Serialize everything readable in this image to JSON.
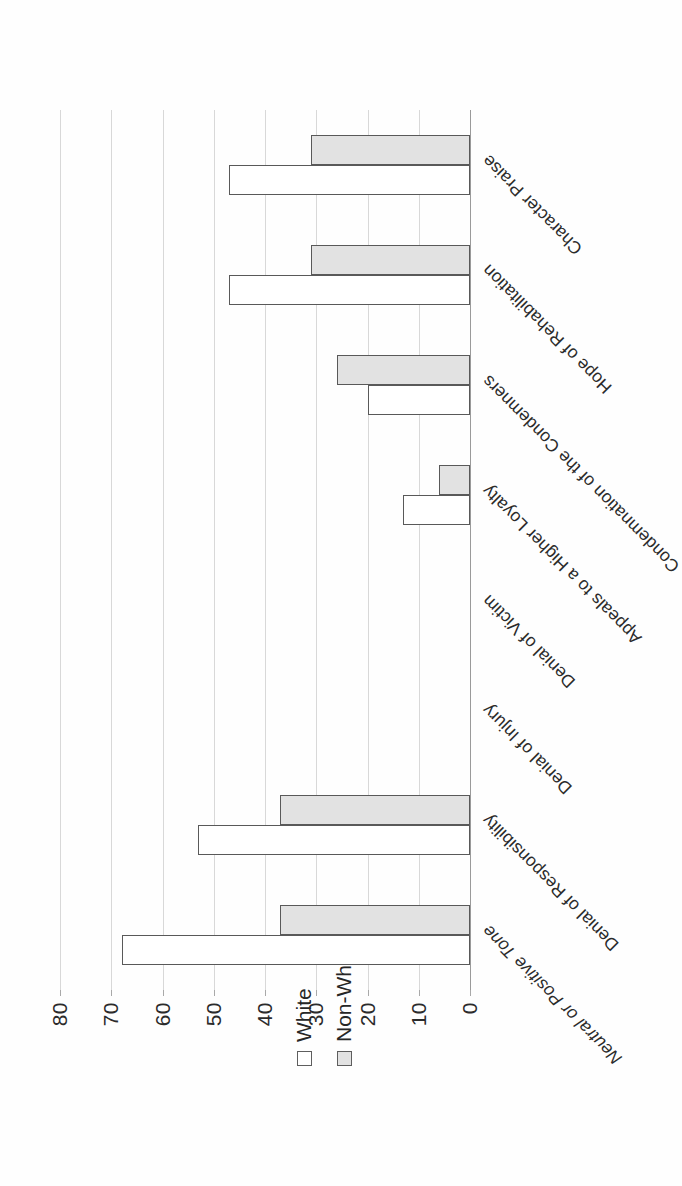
{
  "chart_data": {
    "type": "bar",
    "orientation": "vertical-rendered-rotated",
    "title": "",
    "xlabel": "",
    "ylabel": "",
    "ylim": [
      0,
      80
    ],
    "grid": true,
    "legend_position": "left",
    "tick_labels": [
      "0",
      "10",
      "20",
      "30",
      "40",
      "50",
      "60",
      "70",
      "80"
    ],
    "tick_values": [
      0,
      10,
      20,
      30,
      40,
      50,
      60,
      70,
      80
    ],
    "categories": [
      "Neutral or Positive Tone",
      "Denial of Responsibility",
      "Denial of Injury",
      "Denial of Victim",
      "Appeals to a Higher Loyalty",
      "Condemnation of the Condemners",
      "Hope of Rehabilitation",
      "Character Praise"
    ],
    "series": [
      {
        "name": "White",
        "values": [
          68,
          53,
          0,
          0,
          13,
          20,
          47,
          47
        ]
      },
      {
        "name": "Non-White",
        "values": [
          37,
          37,
          0,
          0,
          6,
          26,
          31,
          31
        ]
      }
    ]
  },
  "legend": {
    "items": [
      {
        "label": "White",
        "swatch": "white-open-square"
      },
      {
        "label": "Non-White",
        "swatch": "gray-filled-square"
      }
    ]
  },
  "colors": {
    "series_white_fill": "#ffffff",
    "series_nonwhite_fill": "#e2e2e2",
    "bar_outline": "#595959",
    "gridline": "#d8d8d8",
    "axis": "#9a9a9a",
    "text": "#262626",
    "page_background": "#ffffff"
  }
}
